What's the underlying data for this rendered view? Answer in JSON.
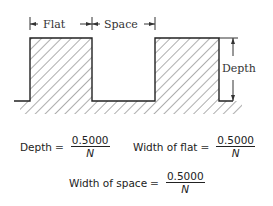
{
  "diagram": {
    "labels": {
      "flat": "Flat",
      "space": "Space",
      "depth": "Depth"
    }
  },
  "equations": [
    {
      "lhs": "Depth",
      "op": "=",
      "numerator": "0.5000",
      "denominator": "N"
    },
    {
      "lhs": "Width of flat",
      "op": "=",
      "numerator": "0.5000",
      "denominator": "N"
    },
    {
      "lhs": "Width of space",
      "op": "=",
      "numerator": "0.5000",
      "denominator": "N"
    }
  ]
}
